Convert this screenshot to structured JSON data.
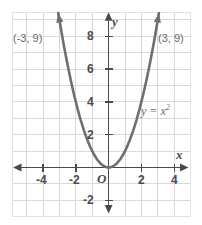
{
  "chart_data": {
    "type": "line",
    "title": "",
    "subtitle": "",
    "xlabel": "x",
    "ylabel": "y",
    "equation": "y = x",
    "equation_exponent": "2",
    "function": "y = x^2",
    "xlim": [
      -5.7,
      5.4
    ],
    "ylim": [
      -3.2,
      10.2
    ],
    "grid": true,
    "grid_step": 1,
    "legend": "none",
    "origin_label": "O",
    "x_ticks": [
      {
        "value": -4,
        "label": "-4"
      },
      {
        "value": -2,
        "label": "-2"
      },
      {
        "value": 2,
        "label": "2"
      },
      {
        "value": 4,
        "label": "4"
      }
    ],
    "y_ticks": [
      {
        "value": -2,
        "label": "-2"
      },
      {
        "value": 2,
        "label": "2"
      },
      {
        "value": 4,
        "label": "4"
      },
      {
        "value": 6,
        "label": "6"
      },
      {
        "value": 8,
        "label": "8"
      }
    ],
    "series": [
      {
        "name": "y = x^2",
        "color": "#6f6f72",
        "x": [
          -3.07,
          -2.9,
          -2.7,
          -2.5,
          -2.3,
          -2.1,
          -1.9,
          -1.7,
          -1.5,
          -1.3,
          -1.1,
          -0.9,
          -0.7,
          -0.5,
          -0.3,
          -0.1,
          0,
          0.1,
          0.3,
          0.5,
          0.7,
          0.9,
          1.1,
          1.3,
          1.5,
          1.7,
          1.9,
          2.1,
          2.3,
          2.5,
          2.7,
          2.9,
          3.07
        ],
        "y": [
          9.42,
          8.41,
          7.29,
          6.25,
          5.29,
          4.41,
          3.61,
          2.89,
          2.25,
          1.69,
          1.21,
          0.81,
          0.49,
          0.25,
          0.09,
          0.01,
          0,
          0.01,
          0.09,
          0.25,
          0.49,
          0.81,
          1.21,
          1.69,
          2.25,
          2.89,
          3.61,
          4.41,
          5.29,
          6.25,
          7.29,
          8.41,
          9.42
        ],
        "arrow_ends": [
          "start",
          "end"
        ]
      }
    ],
    "annotations": [
      {
        "name": "point-label-left",
        "text": "(-3, 9)",
        "x": -3,
        "y": 9
      },
      {
        "name": "point-label-right",
        "text": "(3, 9)",
        "x": 3,
        "y": 9
      },
      {
        "name": "equation-label",
        "text": "y = x2",
        "x": 3.6,
        "y": 3.7
      }
    ],
    "colors": {
      "curve": "#6f6f72",
      "axis": "#4a4a4c",
      "grid": "#d8d8dc",
      "frame": "#e2e2e6",
      "background": "#ffffff",
      "label_text": "#4b4b4d",
      "annotation_text": "#6a6a6c"
    }
  }
}
